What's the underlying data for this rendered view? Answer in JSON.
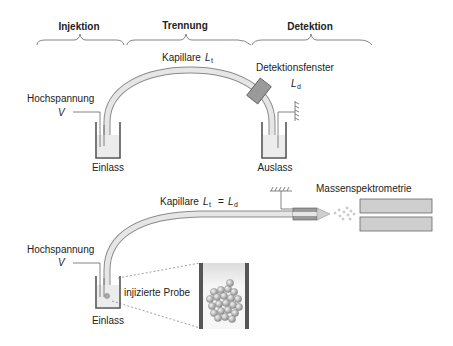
{
  "sections": {
    "injection": "Injektion",
    "separation": "Trennung",
    "detection": "Detektion"
  },
  "top_diagram": {
    "capillary_label": "Kapillare",
    "capillary_symbol": "L",
    "capillary_subscript": "t",
    "detection_window_label": "Detektionsfenster",
    "detection_symbol": "L",
    "detection_subscript": "d",
    "high_voltage_label": "Hochspannung",
    "voltage_symbol": "V",
    "inlet_label": "Einlass",
    "outlet_label": "Auslass"
  },
  "bottom_diagram": {
    "capillary_label": "Kapillare",
    "capillary_symbol_left": "L",
    "capillary_subscript_left": "t",
    "equals": "=",
    "capillary_symbol_right": "L",
    "capillary_subscript_right": "d",
    "mass_spec_label": "Massenspektrometrie",
    "high_voltage_label": "Hochspannung",
    "voltage_symbol": "V",
    "inlet_label": "Einlass",
    "injected_sample_label": "injizierte Probe"
  },
  "colors": {
    "capillary_fill": "#e6e6e6",
    "capillary_stroke": "#8a8a8a",
    "window_fill": "#9a9a9a",
    "vial_stroke": "#555555",
    "liquid": "#ececec",
    "ms_fill": "#cfcfcf"
  }
}
